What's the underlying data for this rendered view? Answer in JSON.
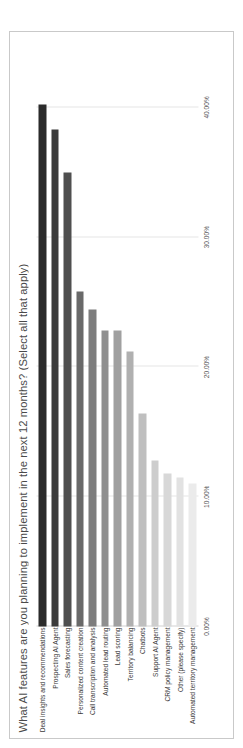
{
  "card": {
    "title": "What AI features are you planning to implement in the next 12 months? (Select all that apply)"
  },
  "chart_data": {
    "type": "bar",
    "orientation": "horizontal",
    "title": "What AI features are you planning to implement in the next 12 months? (Select all that apply)",
    "xlabel": "",
    "ylabel": "",
    "xlim": [
      0,
      45
    ],
    "grid": true,
    "legend": false,
    "tick_labels": [
      "0.00%",
      "10.00%",
      "20.00%",
      "30.00%",
      "40.00%"
    ],
    "ticks": [
      0,
      10,
      20,
      30,
      40
    ],
    "categories": [
      "Deal insights and recommendations",
      "Prospecting AI Agent",
      "Sales forecasting",
      "Personalized content creation",
      "Call transcription and analysis",
      "Automated lead routing",
      "Lead scoring",
      "Territory balancing",
      "Chatbots",
      "Support AI Agent",
      "CRM policy management",
      "Other (please specify)",
      "Automated territory management"
    ],
    "values": [
      40.2,
      38.3,
      35.0,
      25.8,
      24.4,
      22.8,
      22.8,
      21.2,
      16.4,
      12.8,
      11.8,
      11.5,
      11.0
    ],
    "colors": [
      "#2b2b2b",
      "#3b3b3b",
      "#4f4f4f",
      "#696969",
      "#7d7d7d",
      "#8f8f8f",
      "#a0a0a0",
      "#b0b0b0",
      "#bfbfbf",
      "#cdcdcd",
      "#d8d8d8",
      "#e2e2e2",
      "#ebebeb"
    ]
  }
}
